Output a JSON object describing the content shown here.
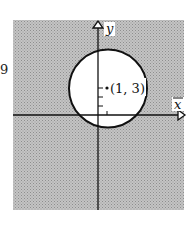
{
  "figure": {
    "side_label": "9",
    "x_axis_label": "x",
    "y_axis_label": "y",
    "point_label": "(1, 3)",
    "center": [
      1,
      3
    ],
    "radius_units": 4.3,
    "shading": "outside circle",
    "colors": {
      "shaded_region": "#b8b8b8",
      "circle_interior": "#ffffff",
      "stroke": "#111111"
    }
  }
}
